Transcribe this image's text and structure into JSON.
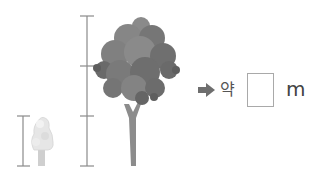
{
  "problem": {
    "approx_label": "약",
    "answer_value": "",
    "unit": "m"
  },
  "figure": {
    "small_tree": {
      "ruler_segments": 1
    },
    "large_tree": {
      "ruler_segments": 3
    },
    "colors": {
      "ruler": "#8a8a8a",
      "large_canopy": "#7a7a7a",
      "large_trunk": "#8c8c8c",
      "small_canopy": "#e4e4e4",
      "small_trunk": "#cfcfcf",
      "arrow": "#6e6e6e"
    }
  }
}
